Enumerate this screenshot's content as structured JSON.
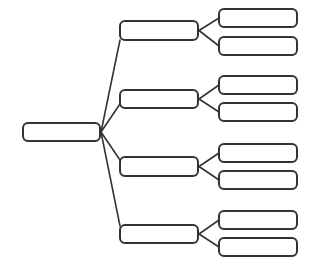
{
  "diagram": {
    "type": "tree",
    "orientation": "left-to-right",
    "stroke_color": "#333333",
    "background": "#ffffff",
    "root": {
      "label": "",
      "x": 22,
      "y": 122,
      "w": 79,
      "h": 20
    },
    "branches": [
      {
        "label": "",
        "x": 119,
        "y": 20,
        "w": 80,
        "h": 21,
        "attach_y": 40,
        "leaves": [
          {
            "label": "",
            "x": 218,
            "y": 8,
            "w": 80,
            "h": 20
          },
          {
            "label": "",
            "x": 218,
            "y": 36,
            "w": 80,
            "h": 20
          }
        ]
      },
      {
        "label": "",
        "x": 119,
        "y": 89,
        "w": 80,
        "h": 20,
        "attach_y": 104,
        "leaves": [
          {
            "label": "",
            "x": 218,
            "y": 75,
            "w": 80,
            "h": 20
          },
          {
            "label": "",
            "x": 218,
            "y": 102,
            "w": 80,
            "h": 20
          }
        ]
      },
      {
        "label": "",
        "x": 119,
        "y": 156,
        "w": 80,
        "h": 21,
        "attach_y": 160,
        "leaves": [
          {
            "label": "",
            "x": 218,
            "y": 143,
            "w": 80,
            "h": 20
          },
          {
            "label": "",
            "x": 218,
            "y": 170,
            "w": 80,
            "h": 20
          }
        ]
      },
      {
        "label": "",
        "x": 119,
        "y": 224,
        "w": 80,
        "h": 20,
        "attach_y": 226,
        "leaves": [
          {
            "label": "",
            "x": 218,
            "y": 210,
            "w": 80,
            "h": 20
          },
          {
            "label": "",
            "x": 218,
            "y": 237,
            "w": 80,
            "h": 20
          }
        ]
      }
    ]
  }
}
